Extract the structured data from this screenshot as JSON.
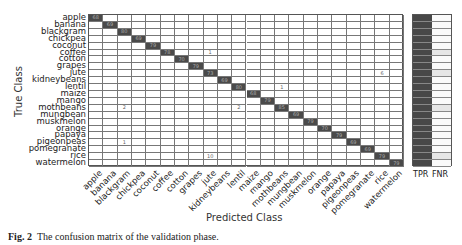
{
  "caption": {
    "label": "Fig. 2",
    "text": "The confusion matrix of the validation phase."
  },
  "chart_data": {
    "type": "heatmap",
    "title": "",
    "xlabel": "Predicted Class",
    "ylabel": "True Class",
    "categories": [
      "apple",
      "banana",
      "blackgram",
      "chickpea",
      "coconut",
      "coffee",
      "cotton",
      "grapes",
      "jute",
      "kidneybeans",
      "lentil",
      "maize",
      "mango",
      "mothbeans",
      "mungbean",
      "muskmelon",
      "orange",
      "papaya",
      "pigeonpeas",
      "pomegranate",
      "rice",
      "watermelon"
    ],
    "diagonal": [
      68,
      69,
      80,
      69,
      79,
      78,
      70,
      79,
      73,
      69,
      80,
      68,
      79,
      85,
      69,
      79,
      70,
      79,
      69,
      69,
      79,
      79
    ],
    "off_diagonal": [
      {
        "true": "coffee",
        "pred": "jute",
        "value": 1
      },
      {
        "true": "jute",
        "pred": "rice",
        "value": 6
      },
      {
        "true": "lentil",
        "pred": "mothbeans",
        "value": 1
      },
      {
        "true": "mothbeans",
        "pred": "blackgram",
        "value": 2
      },
      {
        "true": "mothbeans",
        "pred": "lentil",
        "value": 2
      },
      {
        "true": "pigeonpeas",
        "pred": "blackgram",
        "value": 1
      },
      {
        "true": "rice",
        "pred": "jute",
        "value": 10
      }
    ],
    "side_panel": {
      "columns": [
        "TPR",
        "FNR"
      ]
    },
    "legend": "none",
    "grid": true
  }
}
